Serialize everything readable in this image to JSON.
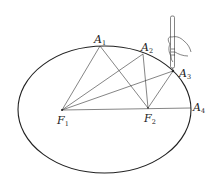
{
  "diagram": {
    "type": "ellipse-foci-construction",
    "ellipse": {
      "cx": 104.5,
      "cy": 109.5,
      "rx": 86.5,
      "ry": 63.5,
      "stroke": "#222222"
    },
    "foci": [
      {
        "id": "F1",
        "letter": "F",
        "sub": "1",
        "x": 62,
        "y": 110
      },
      {
        "id": "F2",
        "letter": "F",
        "sub": "2",
        "x": 148,
        "y": 108
      }
    ],
    "points": [
      {
        "id": "A1",
        "letter": "A",
        "sub": "1",
        "x": 100,
        "y": 46
      },
      {
        "id": "A2",
        "letter": "A",
        "sub": "2",
        "x": 143,
        "y": 54
      },
      {
        "id": "A3",
        "letter": "A",
        "sub": "3",
        "x": 173,
        "y": 71
      },
      {
        "id": "A4",
        "letter": "A",
        "sub": "4",
        "x": 191,
        "y": 108
      }
    ],
    "segments": [
      [
        "F1",
        "A1"
      ],
      [
        "A1",
        "F2"
      ],
      [
        "F1",
        "A2"
      ],
      [
        "A2",
        "F2"
      ],
      [
        "F1",
        "A3"
      ],
      [
        "A3",
        "F2"
      ],
      [
        "F1",
        "A4"
      ]
    ],
    "labels": {
      "A1": {
        "letter": "A",
        "sub": "1"
      },
      "A2": {
        "letter": "A",
        "sub": "2"
      },
      "A3": {
        "letter": "A",
        "sub": "3"
      },
      "A4": {
        "letter": "A",
        "sub": "4"
      },
      "F1": {
        "letter": "F",
        "sub": "1"
      },
      "F2": {
        "letter": "F",
        "sub": "2"
      }
    },
    "illustration": "hand-holding-pen-at-A3"
  }
}
